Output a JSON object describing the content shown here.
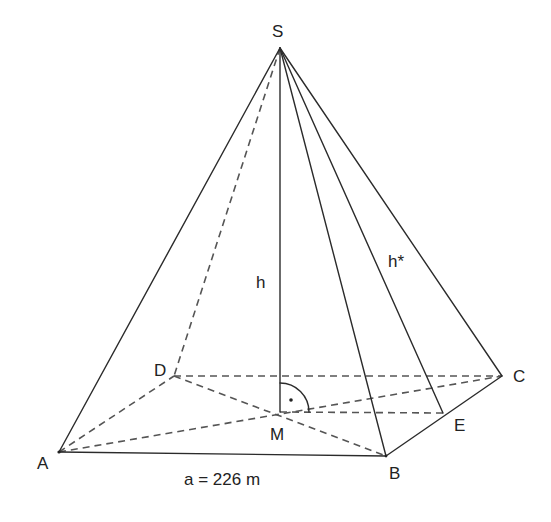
{
  "diagram": {
    "type": "square pyramid",
    "colors": {
      "line": "#2b2b2b",
      "hidden_line": "#555555",
      "text": "#222222",
      "background": "#ffffff"
    },
    "vertices": {
      "S": {
        "label": "S",
        "x": 280,
        "y": 48
      },
      "A": {
        "label": "A",
        "x": 59,
        "y": 452
      },
      "B": {
        "label": "B",
        "x": 386,
        "y": 456
      },
      "C": {
        "label": "C",
        "x": 502,
        "y": 376
      },
      "D": {
        "label": "D",
        "x": 174,
        "y": 376
      },
      "M": {
        "label": "M",
        "x": 280,
        "y": 412
      },
      "E": {
        "label": "E",
        "x": 443,
        "y": 413
      }
    },
    "labels": {
      "height": "h",
      "slant_height": "h*",
      "base_edge": "a = 226 m",
      "right_angle_mark": "·"
    },
    "edges_visible": [
      "S-A",
      "S-B",
      "S-C",
      "S-E",
      "S-M",
      "A-B",
      "B-C"
    ],
    "edges_hidden": [
      "S-D",
      "A-D",
      "D-C",
      "A-C",
      "D-B",
      "M-E"
    ]
  }
}
